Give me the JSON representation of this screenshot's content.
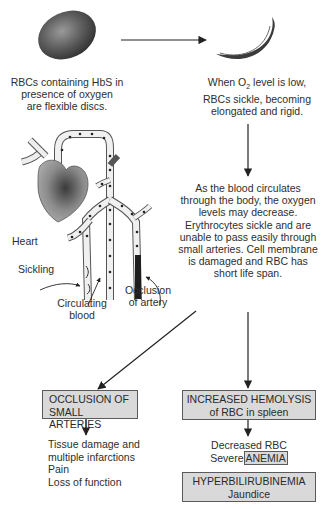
{
  "diagram": {
    "colors": {
      "background": "#ffffff",
      "box_fill": "#d9d9d9",
      "box_border": "#5a5a5a",
      "text": "#2e2e2e",
      "cell": "#555555"
    },
    "top": {
      "normal_cell_caption": [
        "RBCs containing HbS in",
        "presence of oxygen",
        "are flexible discs."
      ],
      "sickle_cell_caption_line1_pre": "When O",
      "sickle_cell_caption_line1_sub": "2",
      "sickle_cell_caption_line1_post": " level is low,",
      "sickle_cell_caption_rest": [
        "RBCs sickle, becoming",
        "elongated and rigid."
      ]
    },
    "illustration": {
      "labels": {
        "heart": "Heart",
        "sickling": "Sickling",
        "circulating_blood": [
          "Circulating",
          "blood"
        ],
        "occlusion": [
          "Occlusion",
          "of artery"
        ]
      }
    },
    "middle": {
      "circulation_text": [
        "As the blood circulates",
        "through the body, the oxygen",
        "levels may decrease.",
        "Erythrocytes sickle and are",
        "unable to pass easily through",
        "small arteries. Cell membrane",
        "is damaged and RBC has",
        "short life span."
      ]
    },
    "left_branch": {
      "box": [
        "OCCLUSION OF",
        "SMALL ARTERIES"
      ],
      "effects": [
        "Tissue damage and",
        "multiple infarctions",
        "Pain",
        "Loss of function"
      ]
    },
    "right_branch": {
      "box": [
        "INCREASED HEMOLYSIS",
        "of RBC in spleen"
      ],
      "effect_line1": "Decreased RBC",
      "effect_line2_pre": "Severe",
      "effect_line2_boxed": "ANEMIA",
      "bottom_box": [
        "HYPERBILIRUBINEMIA",
        "Jaundice"
      ]
    }
  }
}
